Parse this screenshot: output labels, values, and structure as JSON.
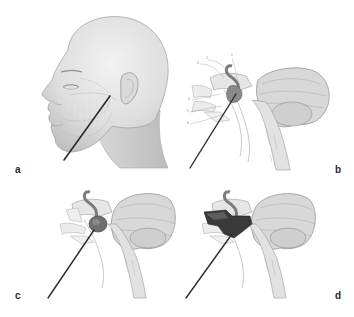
{
  "figure": {
    "panels": [
      {
        "id": "a",
        "label": "a",
        "description": "Lateral view of head with needle inserted below the mandible toward the skull base"
      },
      {
        "id": "b",
        "label": "b",
        "description": "Sagittal section of skull base, brainstem and cerebellum with needle trajectory; numbered anatomical callouts"
      },
      {
        "id": "c",
        "label": "c",
        "description": "Needle tip reaching target lesion at the skull base"
      },
      {
        "id": "d",
        "label": "d",
        "description": "Target region darkened after treatment with needle in place"
      }
    ],
    "callouts_b": [
      "1",
      "2",
      "3",
      "4",
      "5",
      "6"
    ],
    "colors": {
      "background": "#ffffff",
      "skin": "#e4e4e4",
      "skin_shadow": "#c8c8c8",
      "line": "#9a9a9a",
      "needle": "#2b2b2b",
      "target_light": "#6e6e6e",
      "target_dark": "#3a3a3a",
      "label": "#2a2a2a"
    }
  }
}
